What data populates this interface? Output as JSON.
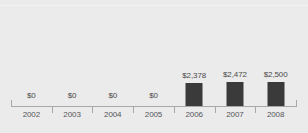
{
  "chart_data": {
    "type": "bar",
    "title": "",
    "subtitle": "",
    "xlabel": "",
    "ylabel": "",
    "grid": false,
    "legend": false,
    "axis_range": [
      0,
      2500
    ],
    "categories": [
      "2002",
      "2003",
      "2004",
      "2005",
      "2006",
      "2007",
      "2008"
    ],
    "values": [
      0,
      0,
      0,
      0,
      2378,
      2472,
      2500
    ],
    "value_labels": [
      "$0",
      "$0",
      "$0",
      "$0",
      "$2,378",
      "$2,472",
      "$2,500"
    ]
  },
  "style": {
    "background_color": "#ebebeb",
    "bar_color": "#3a3a3a",
    "axis_color": "#a8a8a8",
    "label_color": "#4a4a4a",
    "category_label_color": "#55555a"
  }
}
